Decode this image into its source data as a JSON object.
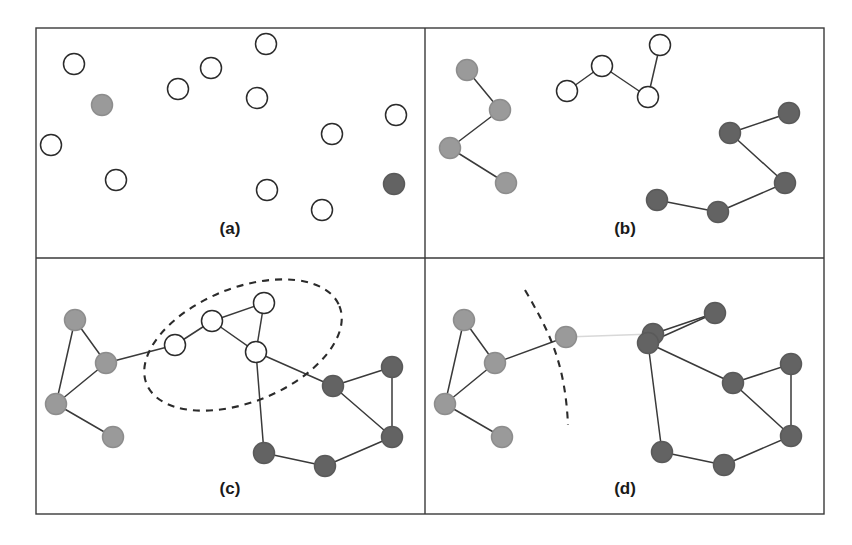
{
  "figure": {
    "caption_style": "four-panel-graph-clustering",
    "panels": [
      {
        "id": "a",
        "label": "(a)",
        "label_x": 230,
        "label_y": 234
      },
      {
        "id": "b",
        "label": "(b)",
        "label_x": 625,
        "label_y": 234
      },
      {
        "id": "c",
        "label": "(c)",
        "label_x": 230,
        "label_y": 494
      },
      {
        "id": "d",
        "label": "(d)",
        "label_x": 625,
        "label_y": 494
      }
    ],
    "frame": {
      "left": 36,
      "top": 28,
      "right": 824,
      "bottom": 514,
      "v_divider_x": 425,
      "h_divider_y": 258
    },
    "colors": {
      "white_node": "#ffffff",
      "light_node": "#9a9a9a",
      "dark_node": "#636363",
      "edge": "#3a3a3a",
      "cut_edge": "#d8d8d8",
      "border": "#3a3a3a",
      "label_text": "#1a1a1a",
      "page_background": "#ffffff"
    },
    "node_radius": 10.5
  },
  "chart_data": {
    "type": "diagram",
    "panel_a": {
      "label": "(a)",
      "description": "Unconnected scattered nodes, mostly unlabeled (white), two pre-labeled seeds",
      "nodes": [
        {
          "id": "a1",
          "x": 74,
          "y": 64,
          "color": "white"
        },
        {
          "id": "a2",
          "x": 102,
          "y": 105,
          "color": "light"
        },
        {
          "id": "a3",
          "x": 178,
          "y": 89,
          "color": "white"
        },
        {
          "id": "a4",
          "x": 211,
          "y": 68,
          "color": "white"
        },
        {
          "id": "a5",
          "x": 266,
          "y": 44,
          "color": "white"
        },
        {
          "id": "a6",
          "x": 257,
          "y": 98,
          "color": "white"
        },
        {
          "id": "a7",
          "x": 396,
          "y": 115,
          "color": "white"
        },
        {
          "id": "a8",
          "x": 332,
          "y": 134,
          "color": "white"
        },
        {
          "id": "a9",
          "x": 51,
          "y": 145,
          "color": "white"
        },
        {
          "id": "a10",
          "x": 116,
          "y": 180,
          "color": "white"
        },
        {
          "id": "a11",
          "x": 267,
          "y": 190,
          "color": "white"
        },
        {
          "id": "a12",
          "x": 322,
          "y": 210,
          "color": "white"
        },
        {
          "id": "a13",
          "x": 394,
          "y": 184,
          "color": "dark"
        }
      ],
      "edges": []
    },
    "panel_b": {
      "label": "(b)",
      "description": "Three separate chains form: light-gray chain (left), white chain (top center), dark-gray chain (right)",
      "nodes": [
        {
          "id": "b1",
          "x": 467,
          "y": 70,
          "color": "light"
        },
        {
          "id": "b2",
          "x": 500,
          "y": 110,
          "color": "light"
        },
        {
          "id": "b3",
          "x": 450,
          "y": 148,
          "color": "light"
        },
        {
          "id": "b4",
          "x": 506,
          "y": 183,
          "color": "light"
        },
        {
          "id": "b5",
          "x": 567,
          "y": 91,
          "color": "white"
        },
        {
          "id": "b6",
          "x": 602,
          "y": 66,
          "color": "white"
        },
        {
          "id": "b7",
          "x": 648,
          "y": 97,
          "color": "white"
        },
        {
          "id": "b8",
          "x": 660,
          "y": 45,
          "color": "white"
        },
        {
          "id": "b9",
          "x": 730,
          "y": 133,
          "color": "dark"
        },
        {
          "id": "b10",
          "x": 789,
          "y": 113,
          "color": "dark"
        },
        {
          "id": "b11",
          "x": 785,
          "y": 183,
          "color": "dark"
        },
        {
          "id": "b12",
          "x": 718,
          "y": 212,
          "color": "dark"
        },
        {
          "id": "b13",
          "x": 657,
          "y": 200,
          "color": "dark"
        }
      ],
      "edges": [
        [
          "b1",
          "b2"
        ],
        [
          "b2",
          "b3"
        ],
        [
          "b3",
          "b4"
        ],
        [
          "b5",
          "b6"
        ],
        [
          "b6",
          "b7"
        ],
        [
          "b7",
          "b8"
        ],
        [
          "b9",
          "b10"
        ],
        [
          "b9",
          "b11"
        ],
        [
          "b11",
          "b12"
        ],
        [
          "b12",
          "b13"
        ]
      ]
    },
    "panel_c": {
      "label": "(c)",
      "description": "Clusters merge into one connected graph; dashed ellipse encircles the four still-unlabeled white nodes",
      "nodes": [
        {
          "id": "c1",
          "x": 75,
          "y": 320,
          "color": "light"
        },
        {
          "id": "c2",
          "x": 106,
          "y": 363,
          "color": "light"
        },
        {
          "id": "c3",
          "x": 56,
          "y": 404,
          "color": "light"
        },
        {
          "id": "c4",
          "x": 113,
          "y": 437,
          "color": "light"
        },
        {
          "id": "c5",
          "x": 175,
          "y": 345,
          "color": "white"
        },
        {
          "id": "c6",
          "x": 212,
          "y": 321,
          "color": "white"
        },
        {
          "id": "c7",
          "x": 264,
          "y": 303,
          "color": "white"
        },
        {
          "id": "c8",
          "x": 256,
          "y": 352,
          "color": "white"
        },
        {
          "id": "c9",
          "x": 333,
          "y": 386,
          "color": "dark"
        },
        {
          "id": "c10",
          "x": 392,
          "y": 367,
          "color": "dark"
        },
        {
          "id": "c11",
          "x": 392,
          "y": 437,
          "color": "dark"
        },
        {
          "id": "c12",
          "x": 325,
          "y": 466,
          "color": "dark"
        },
        {
          "id": "c13",
          "x": 264,
          "y": 453,
          "color": "dark"
        }
      ],
      "edges": [
        [
          "c1",
          "c2"
        ],
        [
          "c1",
          "c3"
        ],
        [
          "c2",
          "c3"
        ],
        [
          "c3",
          "c4"
        ],
        [
          "c2",
          "c5"
        ],
        [
          "c5",
          "c6"
        ],
        [
          "c6",
          "c7"
        ],
        [
          "c6",
          "c8"
        ],
        [
          "c7",
          "c8"
        ],
        [
          "c8",
          "c9"
        ],
        [
          "c8",
          "c13"
        ],
        [
          "c9",
          "c10"
        ],
        [
          "c9",
          "c11"
        ],
        [
          "c10",
          "c11"
        ],
        [
          "c11",
          "c12"
        ],
        [
          "c12",
          "c13"
        ]
      ],
      "annotation": {
        "type": "dashed-ellipse",
        "cx": 243,
        "cy": 345,
        "rx": 104,
        "ry": 57,
        "rotation": -22
      }
    },
    "panel_d": {
      "label": "(d)",
      "description": "White nodes absorbed into neighboring clusters; dashed curve marks the cluster boundary and one edge is cut",
      "nodes": [
        {
          "id": "d1",
          "x": 464,
          "y": 320,
          "color": "light"
        },
        {
          "id": "d2",
          "x": 495,
          "y": 363,
          "color": "light"
        },
        {
          "id": "d3",
          "x": 445,
          "y": 404,
          "color": "light"
        },
        {
          "id": "d4",
          "x": 502,
          "y": 437,
          "color": "light"
        },
        {
          "id": "d5",
          "x": 566,
          "y": 337,
          "color": "light"
        },
        {
          "id": "d6",
          "x": 653,
          "y": 334,
          "color": "dark"
        },
        {
          "id": "d7",
          "x": 715,
          "y": 313,
          "color": "dark"
        },
        {
          "id": "d8",
          "x": 648,
          "y": 343,
          "color": "dark"
        },
        {
          "id": "d9",
          "x": 733,
          "y": 383,
          "color": "dark"
        },
        {
          "id": "d10",
          "x": 791,
          "y": 364,
          "color": "dark"
        },
        {
          "id": "d11",
          "x": 791,
          "y": 436,
          "color": "dark"
        },
        {
          "id": "d12",
          "x": 724,
          "y": 465,
          "color": "dark"
        },
        {
          "id": "d13",
          "x": 662,
          "y": 452,
          "color": "dark"
        }
      ],
      "edges_kept": [
        [
          "d1",
          "d2"
        ],
        [
          "d1",
          "d3"
        ],
        [
          "d2",
          "d3"
        ],
        [
          "d3",
          "d4"
        ],
        [
          "d2",
          "d5"
        ],
        [
          "d6",
          "d7"
        ],
        [
          "d7",
          "d8"
        ],
        [
          "d6",
          "d8"
        ],
        [
          "d8",
          "d9"
        ],
        [
          "d8",
          "d13"
        ],
        [
          "d9",
          "d10"
        ],
        [
          "d9",
          "d11"
        ],
        [
          "d10",
          "d11"
        ],
        [
          "d11",
          "d12"
        ],
        [
          "d12",
          "d13"
        ]
      ],
      "edges_cut": [
        [
          "d5",
          "d6"
        ]
      ],
      "annotation": {
        "type": "dashed-curve",
        "path": "M 525,290 C 548,330 565,360 568,425"
      }
    }
  }
}
